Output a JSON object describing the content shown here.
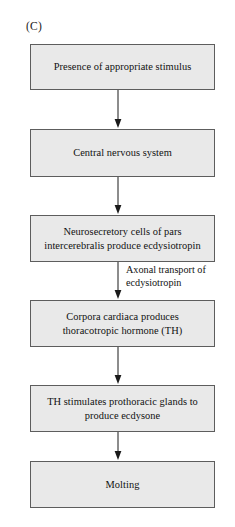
{
  "figure": {
    "panel_label": "(C)",
    "caption_title": "",
    "background_color": "#ffffff",
    "box_fill_color": "#e9e9e9",
    "box_border_color": "#5d5d5d",
    "arrow_color": "#1a1a1a"
  },
  "diagram": {
    "type": "flowchart",
    "orientation": "vertical-top-to-bottom",
    "nodes": [
      {
        "id": "node-1",
        "order": 1,
        "text": "Presence of appropriate stimulus"
      },
      {
        "id": "node-2",
        "order": 2,
        "text": "Central nervous system"
      },
      {
        "id": "node-3",
        "order": 3,
        "text": "Neurosecretory cells of pars intercerebralis produce ecdysiotropin"
      },
      {
        "id": "node-4",
        "order": 4,
        "text": "Corpora cardiaca produces thoracotropic hormone (TH)"
      },
      {
        "id": "node-5",
        "order": 5,
        "text": "TH stimulates prothoracic glands to produce ecdysone"
      },
      {
        "id": "node-6",
        "order": 6,
        "text": "Molting"
      }
    ],
    "edges": [
      {
        "id": "edge-1",
        "from": "node-1",
        "to": "node-2",
        "label": ""
      },
      {
        "id": "edge-2",
        "from": "node-2",
        "to": "node-3",
        "label": ""
      },
      {
        "id": "edge-3",
        "from": "node-3",
        "to": "node-4",
        "label": "Axonal transport of ecdysiotropin"
      },
      {
        "id": "edge-4",
        "from": "node-4",
        "to": "node-5",
        "label": ""
      },
      {
        "id": "edge-5",
        "from": "node-5",
        "to": "node-6",
        "label": ""
      }
    ]
  }
}
